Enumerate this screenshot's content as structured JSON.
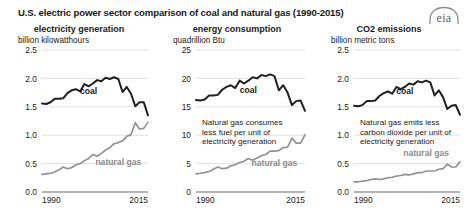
{
  "figure": {
    "title": "U.S. electric power sector comparison of coal and natural gas (1990-2015)",
    "source_logo": "eia",
    "logo_alt": "eia-logo"
  },
  "chart_data": [
    {
      "type": "line",
      "title": "electricity generation",
      "ylabel": "billion kilowatthours",
      "xlabel": "",
      "ylim": [
        0,
        2.5
      ],
      "yticks": [
        "0.0",
        "0.5",
        "1.0",
        "1.5",
        "2.0",
        "2.5"
      ],
      "ytick_values": [
        0,
        0.5,
        1.0,
        1.5,
        2.0,
        2.5
      ],
      "xlim": [
        1990,
        2015
      ],
      "xticks": [
        "1990",
        "2015"
      ],
      "xtick_values": [
        1990,
        2015
      ],
      "grid": true,
      "legend_position": "inline-annotation",
      "x": [
        1990,
        1991,
        1992,
        1993,
        1994,
        1995,
        1996,
        1997,
        1998,
        1999,
        2000,
        2001,
        2002,
        2003,
        2004,
        2005,
        2006,
        2007,
        2008,
        2009,
        2010,
        2011,
        2012,
        2013,
        2014,
        2015
      ],
      "series": [
        {
          "name": "coal",
          "color": "#231f20",
          "label_x": 2001,
          "label_y": 1.72,
          "values": [
            1.56,
            1.55,
            1.58,
            1.64,
            1.64,
            1.65,
            1.74,
            1.79,
            1.81,
            1.77,
            1.9,
            1.86,
            1.91,
            1.97,
            1.95,
            2.01,
            1.99,
            2.02,
            1.99,
            1.76,
            1.85,
            1.73,
            1.51,
            1.58,
            1.58,
            1.35
          ]
        },
        {
          "name": "natural gas",
          "color": "#939393",
          "label_x": 2008,
          "label_y": 0.47,
          "values": [
            0.31,
            0.32,
            0.33,
            0.35,
            0.39,
            0.44,
            0.41,
            0.43,
            0.48,
            0.5,
            0.55,
            0.59,
            0.66,
            0.63,
            0.68,
            0.74,
            0.78,
            0.85,
            0.87,
            0.9,
            0.98,
            1.01,
            1.22,
            1.11,
            1.12,
            1.23
          ]
        }
      ]
    },
    {
      "type": "line",
      "title": "energy consumption",
      "ylabel": "quadrillion Btu",
      "xlabel": "",
      "ylim": [
        0,
        25
      ],
      "yticks": [
        "0",
        "5",
        "10",
        "15",
        "20",
        "25"
      ],
      "ytick_values": [
        0,
        5,
        10,
        15,
        20,
        25
      ],
      "xlim": [
        1990,
        2015
      ],
      "xticks": [
        "1990",
        "2015"
      ],
      "xtick_values": [
        1990,
        2015
      ],
      "grid": true,
      "legend_position": "inline-annotation",
      "annotation": "Natural gas consumes less fuel per unit of electricity generation",
      "annotation_lines": [
        "Natural gas consumes",
        "less fuel per unit of",
        "electricity generation"
      ],
      "x": [
        1990,
        1991,
        1992,
        1993,
        1994,
        1995,
        1996,
        1997,
        1998,
        1999,
        2000,
        2001,
        2002,
        2003,
        2004,
        2005,
        2006,
        2007,
        2008,
        2009,
        2010,
        2011,
        2012,
        2013,
        2014,
        2015
      ],
      "series": [
        {
          "name": "coal",
          "color": "#231f20",
          "label_x": 2002,
          "label_y": 17.4,
          "values": [
            16.2,
            16.1,
            16.3,
            17.0,
            17.0,
            17.1,
            18.0,
            18.5,
            18.8,
            18.3,
            19.6,
            19.1,
            19.6,
            20.2,
            20.0,
            20.6,
            20.4,
            20.7,
            20.4,
            17.9,
            18.8,
            17.5,
            15.3,
            16.0,
            16.1,
            14.3
          ]
        },
        {
          "name": "natural gas",
          "color": "#939393",
          "label_x": 2008,
          "label_y": 4.6,
          "values": [
            3.2,
            3.3,
            3.4,
            3.6,
            4.0,
            4.4,
            4.1,
            4.2,
            4.6,
            4.8,
            5.2,
            5.4,
            5.9,
            5.6,
            6.0,
            6.4,
            6.6,
            7.2,
            7.2,
            7.3,
            7.8,
            7.9,
            9.5,
            8.6,
            8.6,
            10.1
          ]
        }
      ]
    },
    {
      "type": "line",
      "title": "CO2 emissions",
      "ylabel": "billion metric tons",
      "xlabel": "",
      "ylim": [
        0,
        2.5
      ],
      "yticks": [
        "0.0",
        "0.5",
        "1.0",
        "1.5",
        "2.0",
        "2.5"
      ],
      "ytick_values": [
        0,
        0.5,
        1.0,
        1.5,
        2.0,
        2.5
      ],
      "xlim": [
        1990,
        2015
      ],
      "xticks": [
        "1990",
        "2015"
      ],
      "xtick_values": [
        1990,
        2015
      ],
      "grid": true,
      "legend_position": "inline-annotation",
      "annotation": "Natural gas emits less carbon dioxide per unit of electricity generation",
      "annotation_lines": [
        "Natural gas emits less",
        "carbon dioxide per unit of",
        "electricity generation"
      ],
      "x": [
        1990,
        1991,
        1992,
        1993,
        1994,
        1995,
        1996,
        1997,
        1998,
        1999,
        2000,
        2001,
        2002,
        2003,
        2004,
        2005,
        2006,
        2007,
        2008,
        2009,
        2010,
        2011,
        2012,
        2013,
        2014,
        2015
      ],
      "series": [
        {
          "name": "coal",
          "color": "#231f20",
          "label_x": 2002,
          "label_y": 1.73,
          "values": [
            1.52,
            1.51,
            1.53,
            1.6,
            1.6,
            1.61,
            1.69,
            1.74,
            1.77,
            1.73,
            1.85,
            1.81,
            1.85,
            1.91,
            1.89,
            1.95,
            1.93,
            1.96,
            1.93,
            1.7,
            1.79,
            1.67,
            1.46,
            1.52,
            1.53,
            1.36
          ]
        },
        {
          "name": "natural gas",
          "color": "#939393",
          "label_x": 2007,
          "label_y": 0.63,
          "values": [
            0.18,
            0.18,
            0.19,
            0.2,
            0.22,
            0.23,
            0.22,
            0.23,
            0.25,
            0.26,
            0.28,
            0.29,
            0.31,
            0.3,
            0.32,
            0.34,
            0.34,
            0.37,
            0.37,
            0.37,
            0.4,
            0.41,
            0.49,
            0.44,
            0.44,
            0.53
          ]
        }
      ]
    }
  ]
}
